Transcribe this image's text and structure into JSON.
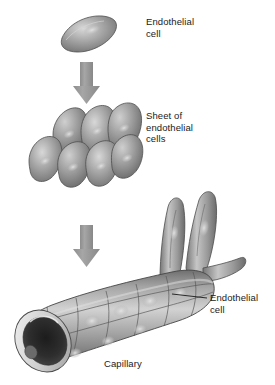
{
  "figure": {
    "background_color": "#ffffff",
    "width": 275,
    "height": 385,
    "stages": [
      {
        "id": "single-cell",
        "label": "Endothelial\ncell",
        "description": "A single lens-shaped endothelial cell with a pale nucleus"
      },
      {
        "id": "cell-sheet",
        "label": "Sheet of\nendothelial\ncells",
        "description": "Seven overlapping endothelial cells forming a flat sheet",
        "cell_count": 7
      },
      {
        "id": "capillary",
        "label": "Capillary",
        "callout_label": "Endothelial\ncell",
        "description": "A branching capillary tube with an open lumen at the lower-left end"
      }
    ],
    "arrows": [
      {
        "id": "arrow-1",
        "direction": "down",
        "color": "#9a9a9a"
      },
      {
        "id": "arrow-2",
        "direction": "down",
        "color": "#9a9a9a"
      }
    ],
    "colors": {
      "cell_fill_light": "#c9c9c9",
      "cell_fill_mid": "#9e9e9e",
      "cell_fill_dark": "#6f6f6f",
      "outline": "#4a4a4a",
      "lumen_dark": "#2a2a2a",
      "arrow": "#9a9a9a",
      "text": "#1a1a1a",
      "leader_line": "#1a1a1a"
    }
  }
}
